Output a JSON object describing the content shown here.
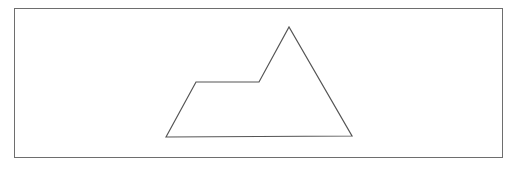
{
  "canvas": {
    "width": 514,
    "height": 170,
    "background": "#ffffff"
  },
  "frame": {
    "x": 14,
    "y": 8,
    "width": 488,
    "height": 149,
    "stroke": "#6e6e6e"
  },
  "shape": {
    "type": "polygon",
    "points": "166,137 196,82 259,82 289,27 352,136",
    "stroke": "#555555",
    "fill": "none"
  }
}
